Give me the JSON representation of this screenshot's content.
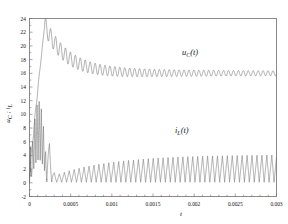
{
  "chart_data": {
    "type": "line",
    "title": "",
    "subtitle": "",
    "xlabel": "t",
    "ylabel": "u_C ; i_L",
    "ylabel_parts": {
      "u": "u",
      "u_sub": "C",
      "sep": "; ",
      "i": "i",
      "i_sub": "L"
    },
    "xlim": [
      0,
      0.003
    ],
    "ylim": [
      -2,
      24
    ],
    "xticks": [
      0,
      0.0005,
      0.001,
      0.0015,
      0.002,
      0.0025,
      0.003
    ],
    "xtick_labels": [
      "0",
      "0.0005",
      "0.001",
      "0.0015",
      "0.002",
      "0.0025",
      "0.003"
    ],
    "yticks": [
      -2,
      0,
      2,
      4,
      6,
      8,
      10,
      12,
      14,
      16,
      18,
      20,
      22,
      24
    ],
    "ytick_labels": [
      "-2",
      "0",
      "2",
      "4",
      "6",
      "8",
      "10",
      "12",
      "14",
      "16",
      "18",
      "20",
      "22",
      "24"
    ],
    "xminor_count": 1,
    "yminor_count": 1,
    "grid": false,
    "legend_position": "inline-annotations",
    "line_color": "#6a6a6a",
    "frame_color": "#6f6f6f",
    "background_color": "#ffffff",
    "annotations": [
      {
        "name": "uC-curve-label",
        "text": "u_C(t)",
        "x": 0.00195,
        "y": 18.6
      },
      {
        "name": "iL-curve-label",
        "text": "i_L(t)",
        "x": 0.00185,
        "y": 7.3
      }
    ],
    "series": [
      {
        "name": "u_C(t)",
        "label": "u_C(t)",
        "description": "Capacitor voltage: fast rise with small early ripple, overshoot peak near 23 at t=0.00018, then decaying oscillatory settle toward 16",
        "steady_state_value": 16,
        "peak_value": 23,
        "peak_time": 0.00018
      },
      {
        "name": "i_L(t)",
        "label": "i_L(t)",
        "description": "Inductor current: large initial transient spikes up to ~12 during 0 to 0.00018, then periodic sawtooth ripple growing from ~1 to ~4 peak",
        "steady_state_peak": 4,
        "steady_state_min": 0,
        "initial_peak": 12
      }
    ]
  }
}
